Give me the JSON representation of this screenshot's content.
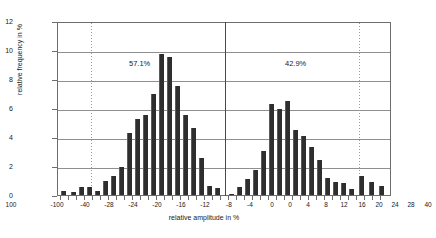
{
  "chart_data": {
    "type": "bar",
    "title": "",
    "subtitle": "",
    "xlabel": "relative amplitude in %",
    "ylabel": "relative frequency in %",
    "ylim": [
      0,
      12
    ],
    "ytick_values": [
      0,
      2,
      4,
      6,
      8,
      10,
      12
    ],
    "ytick_labels": [
      "0",
      "2",
      "4",
      "6",
      "8",
      "10",
      "12"
    ],
    "grid": "horizontal-gridlines-plus-two-dotted-verticals",
    "legend": "none",
    "annotations": [
      {
        "text": "57.1%",
        "side": "left",
        "meaning": "share of negative relative amplitudes"
      },
      {
        "text": "42.9%",
        "side": "right",
        "meaning": "share of positive relative amplitudes"
      }
    ],
    "xtick_labels_left": [
      "-100",
      "-40",
      "-28",
      "-24",
      "-20",
      "-16",
      "-12",
      "-8",
      "-4",
      "0"
    ],
    "xtick_labels_right": [
      "0",
      "4",
      "8",
      "12",
      "16",
      "20",
      "24",
      "28",
      "40",
      "100"
    ],
    "categories": [
      "-100",
      "-60",
      "-40",
      "-36",
      "-32",
      "-30",
      "-28",
      "-26",
      "-24",
      "-22",
      "-20",
      "-18",
      "-16",
      "-15",
      "-14",
      "-13",
      "-12",
      "-11",
      "-10",
      "-9",
      "-8",
      "-7",
      "-6",
      "-5",
      "-4",
      "-3",
      "-2",
      "-1",
      "0",
      "1",
      "2",
      "3",
      "4",
      "5",
      "6",
      "7",
      "8",
      "9",
      "10",
      "11",
      "12",
      "13",
      "14",
      "15",
      "16",
      "17",
      "18",
      "19",
      "20",
      "21",
      "22",
      "23",
      "24",
      "26",
      "28",
      "30",
      "32",
      "36",
      "40",
      "60",
      "100"
    ],
    "values": [
      0.0,
      0.3,
      0.2,
      0.0,
      0.6,
      0.0,
      0.6,
      0.0,
      0.3,
      0.0,
      1.0,
      1.3,
      2.0,
      0.0,
      4.3,
      0.0,
      5.2,
      0.0,
      5.5,
      0.0,
      7.0,
      0.0,
      9.7,
      0.0,
      9.5,
      0.0,
      7.6,
      0.0,
      0.0,
      0.0,
      4.6,
      0.0,
      2.6,
      0.0,
      0.4,
      0.0,
      0.3,
      0.0,
      0.1,
      0.6,
      1.1,
      1.7,
      3.0,
      0.0,
      6.3,
      0.0,
      5.9,
      0.0,
      6.5,
      0.0,
      4.4,
      0.0,
      4.0,
      3.2,
      2.4,
      1.1,
      0.9,
      0.4,
      1.3,
      0.9,
      0.6
    ],
    "left_group_percent": "57.1%",
    "right_group_percent": "42.9%",
    "bars": [
      {
        "x": 60,
        "h": 0.3
      },
      {
        "x": 70,
        "h": 0.2
      },
      {
        "x": 78,
        "h": 0.55
      },
      {
        "x": 86,
        "h": 0.55
      },
      {
        "x": 94,
        "h": 0.28
      },
      {
        "x": 102,
        "h": 1.0
      },
      {
        "x": 110,
        "h": 1.3
      },
      {
        "x": 118,
        "h": 1.95
      },
      {
        "x": 126,
        "h": 4.3
      },
      {
        "x": 134,
        "h": 5.25
      },
      {
        "x": 142,
        "h": 5.5
      },
      {
        "x": 150,
        "h": 7.0
      },
      {
        "x": 158,
        "h": 9.7
      },
      {
        "x": 166,
        "h": 9.5
      },
      {
        "x": 174,
        "h": 7.55
      },
      {
        "x": 182,
        "h": 5.5
      },
      {
        "x": 190,
        "h": 4.6
      },
      {
        "x": 198,
        "h": 2.55
      },
      {
        "x": 206,
        "h": 0.6
      },
      {
        "x": 214,
        "h": 0.45
      },
      {
        "x": 228,
        "h": 0.1
      },
      {
        "x": 236,
        "h": 0.55
      },
      {
        "x": 244,
        "h": 1.1
      },
      {
        "x": 252,
        "h": 1.7
      },
      {
        "x": 260,
        "h": 3.05
      },
      {
        "x": 268,
        "h": 6.3
      },
      {
        "x": 276,
        "h": 5.95
      },
      {
        "x": 284,
        "h": 6.5
      },
      {
        "x": 292,
        "h": 4.45
      },
      {
        "x": 300,
        "h": 4.05
      },
      {
        "x": 308,
        "h": 3.3
      },
      {
        "x": 316,
        "h": 2.4
      },
      {
        "x": 324,
        "h": 1.15
      },
      {
        "x": 332,
        "h": 0.9
      },
      {
        "x": 340,
        "h": 0.8
      },
      {
        "x": 348,
        "h": 0.4
      },
      {
        "x": 358,
        "h": 1.3
      },
      {
        "x": 368,
        "h": 0.9
      },
      {
        "x": 378,
        "h": 0.6
      }
    ],
    "xticks": [
      {
        "x": 60,
        "label": "-100"
      },
      {
        "x": 90,
        "label": "-40"
      },
      {
        "x": 118,
        "label": "-28"
      },
      {
        "x": 142,
        "label": "-24"
      },
      {
        "x": 166,
        "label": "-20"
      },
      {
        "x": 190,
        "label": "-16"
      },
      {
        "x": 214,
        "label": "-12"
      },
      {
        "x": 238,
        "label": "-8"
      },
      {
        "x": 262,
        "label": "-4"
      },
      {
        "x": 286,
        "label": "0"
      }
    ],
    "xticks_right": [
      {
        "x": 0,
        "label": ""
      }
    ],
    "xtick_all": [
      {
        "x": 62,
        "label": "-100"
      },
      {
        "x": 90,
        "label": "-40"
      },
      {
        "x": 116,
        "label": "-28"
      },
      {
        "x": 140,
        "label": "-24"
      },
      {
        "x": 164,
        "label": "-20"
      },
      {
        "x": 188,
        "label": "-16"
      },
      {
        "x": 212,
        "label": "-12"
      },
      {
        "x": 237,
        "label": "-8"
      },
      {
        "x": 261,
        "label": "-4"
      },
      {
        "x": 285,
        "label": "0"
      },
      {
        "x": 310,
        "label": "4"
      },
      {
        "x": 334,
        "label": "8"
      },
      {
        "x": 358,
        "label": "12"
      },
      {
        "x": 382,
        "label": "16"
      },
      {
        "x": 406,
        "label": "20"
      },
      {
        "x": 430,
        "label": "24"
      },
      {
        "x": 454,
        "label": "28"
      },
      {
        "x": 478,
        "label": "40"
      },
      {
        "x": 502,
        "label": "100"
      }
    ]
  },
  "axis": {
    "y_title": "relative frequency in %",
    "x_title": "relative amplitude in %",
    "y_ticks": [
      "12",
      "10",
      "8",
      "6",
      "4",
      "2",
      "0"
    ],
    "x_ticks": [
      "-100",
      "-40",
      "-28",
      "-24",
      "-20",
      "-16",
      "-12",
      "-8",
      "-4",
      "0",
      "4",
      "8",
      "12",
      "16",
      "20",
      "24",
      "28",
      "40",
      "100"
    ]
  },
  "labels": {
    "left_share": "57.1%",
    "right_share": "42.9%"
  },
  "colors": {
    "bar": "#2e2e2e",
    "grid": "#8f8f8f",
    "frame": "#6d6d6d",
    "axis_divider": "#4a4a4a",
    "text": "#1a1a1a",
    "background": "#ffffff"
  }
}
